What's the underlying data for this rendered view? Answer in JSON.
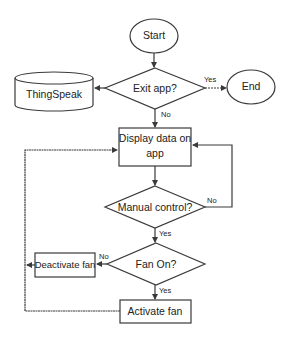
{
  "diagram": {
    "type": "flowchart",
    "nodes": {
      "start": {
        "label": "Start",
        "shape": "ellipse"
      },
      "exit_app": {
        "label": "Exit app?",
        "shape": "diamond"
      },
      "end": {
        "label": "End",
        "shape": "ellipse"
      },
      "thingspeak": {
        "label": "ThingSpeak",
        "shape": "cylinder"
      },
      "display_line1": {
        "label": "Display data on"
      },
      "display_line2": {
        "label": "app"
      },
      "manual_control": {
        "label": "Manual control?",
        "shape": "diamond"
      },
      "fan_on": {
        "label": "Fan On?",
        "shape": "diamond"
      },
      "deactivate_fan": {
        "label": "Deactivate fan",
        "shape": "rectangle"
      },
      "activate_fan": {
        "label": "Activate fan",
        "shape": "rectangle"
      }
    },
    "edges": {
      "exit_yes": "Yes",
      "exit_no": "No",
      "manual_no": "No",
      "manual_yes": "Yes",
      "fan_no": "No",
      "fan_yes": "Yes"
    },
    "colors": {
      "stroke": "#3a3a3a",
      "fill": "#ffffff",
      "text": "#222222"
    }
  }
}
